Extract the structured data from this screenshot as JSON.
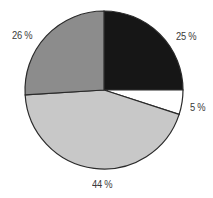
{
  "chart_data": {
    "type": "pie",
    "title": "",
    "start_angle_deg": 0,
    "direction": "clockwise",
    "categories": [
      "Slice A",
      "Slice B",
      "Slice C",
      "Slice D"
    ],
    "values": [
      25,
      5,
      44,
      26
    ],
    "labels": [
      "25 %",
      "5 %",
      "44 %",
      "26 %"
    ],
    "colors": [
      "#161616",
      "#ffffff",
      "#c8c8c8",
      "#8c8c8c"
    ],
    "legend": "none"
  },
  "labels": {
    "slice_0": "25 %",
    "slice_1": "5 %",
    "slice_2": "44 %",
    "slice_3": "26 %"
  }
}
